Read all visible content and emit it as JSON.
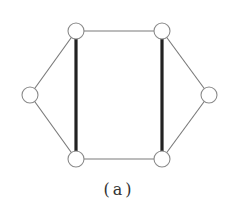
{
  "figure": {
    "caption": "(a)",
    "nodes": [
      {
        "id": "left",
        "x": 30,
        "y": 95
      },
      {
        "id": "top-left",
        "x": 76,
        "y": 31
      },
      {
        "id": "top-right",
        "x": 162,
        "y": 31
      },
      {
        "id": "right",
        "x": 209,
        "y": 95
      },
      {
        "id": "bottom-right",
        "x": 162,
        "y": 159
      },
      {
        "id": "bottom-left",
        "x": 76,
        "y": 159
      }
    ],
    "edges": [
      {
        "from": "left",
        "to": "top-left",
        "style": "thin"
      },
      {
        "from": "left",
        "to": "bottom-left",
        "style": "thin"
      },
      {
        "from": "top-left",
        "to": "top-right",
        "style": "thin"
      },
      {
        "from": "bottom-left",
        "to": "bottom-right",
        "style": "thin"
      },
      {
        "from": "top-right",
        "to": "right",
        "style": "thin"
      },
      {
        "from": "bottom-right",
        "to": "right",
        "style": "thin"
      },
      {
        "from": "top-left",
        "to": "bottom-left",
        "style": "thick"
      },
      {
        "from": "top-right",
        "to": "bottom-right",
        "style": "thick"
      }
    ],
    "node_radius": 8,
    "colors": {
      "thin_edge": "#7a7a7a",
      "thick_edge": "#222222",
      "node_stroke": "#8a8a8a",
      "node_fill": "#ffffff"
    }
  }
}
